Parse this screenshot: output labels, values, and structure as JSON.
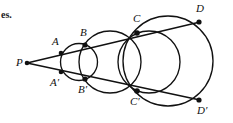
{
  "figure": {
    "kind": "geometry-diagram",
    "width": 233,
    "height": 123,
    "background_color": "#ffffff",
    "stroke_color": "#111111",
    "text_color": "#111111",
    "margin_text": {
      "text": "es.",
      "x": 1,
      "y": 9
    },
    "points": [
      {
        "id": "P",
        "label": "P",
        "x": 27,
        "y": 63,
        "label_x": 16,
        "label_y": 57,
        "dot": true
      },
      {
        "id": "A",
        "label": "A",
        "x": 61,
        "y": 53,
        "label_x": 52,
        "label_y": 36,
        "dot": true
      },
      {
        "id": "Ap",
        "label": "A′",
        "x": 61,
        "y": 72,
        "label_x": 50,
        "label_y": 77,
        "dot": true
      },
      {
        "id": "B",
        "label": "B",
        "x": 85,
        "y": 45,
        "label_x": 80,
        "label_y": 27,
        "dot": true
      },
      {
        "id": "Bp",
        "label": "B′",
        "x": 85,
        "y": 79,
        "label_x": 78,
        "label_y": 84,
        "dot": true
      },
      {
        "id": "C",
        "label": "C",
        "x": 137,
        "y": 33,
        "label_x": 133,
        "label_y": 13,
        "dot": true
      },
      {
        "id": "Cp",
        "label": "C′",
        "x": 137,
        "y": 91,
        "label_x": 130,
        "label_y": 96,
        "dot": true
      },
      {
        "id": "D",
        "label": "D",
        "x": 199,
        "y": 22,
        "label_x": 196,
        "label_y": 3,
        "dot": true
      },
      {
        "id": "Dp",
        "label": "D′",
        "x": 199,
        "y": 100,
        "label_x": 197,
        "label_y": 105,
        "dot": true
      }
    ],
    "rays": [
      {
        "id": "ray-upper",
        "from": "P",
        "through": [
          "A",
          "B",
          "C",
          "D"
        ],
        "x1": 27,
        "y1": 63,
        "x2": 200,
        "y2": 22
      },
      {
        "id": "ray-lower",
        "from": "P",
        "through": [
          "Ap",
          "Bp",
          "Cp",
          "Dp"
        ],
        "x1": 27,
        "y1": 63,
        "x2": 200,
        "y2": 100
      }
    ],
    "circles": [
      {
        "id": "circle-1",
        "name": "small-circle-ABA'B'",
        "cx": 79,
        "cy": 62,
        "r": 18.5,
        "through": [
          "A",
          "Ap",
          "B",
          "Bp"
        ]
      },
      {
        "id": "circle-2",
        "name": "mid-circle-BCB'C'",
        "cx": 110,
        "cy": 62,
        "r": 31,
        "through": [
          "B",
          "Bp",
          "C",
          "Cp"
        ]
      },
      {
        "id": "circle-3",
        "name": "lens-circle-CC'",
        "cx": 149,
        "cy": 62,
        "r": 31,
        "through": [
          "C",
          "Cp"
        ]
      },
      {
        "id": "circle-4",
        "name": "large-circle-CDC'D'",
        "cx": 168,
        "cy": 61,
        "r": 45,
        "through": [
          "C",
          "Cp",
          "D",
          "Dp"
        ]
      }
    ]
  }
}
